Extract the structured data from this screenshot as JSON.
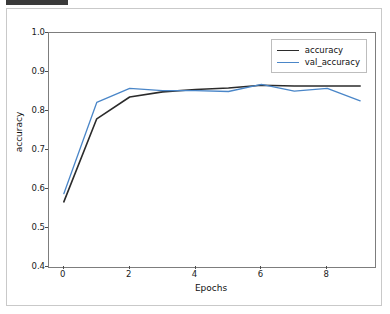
{
  "chart_data": {
    "type": "line",
    "title": "",
    "xlabel": "Epochs",
    "ylabel": "accuracy",
    "x": [
      0,
      1,
      2,
      3,
      4,
      5,
      6,
      7,
      8,
      9
    ],
    "xlim": [
      -0.45,
      9.45
    ],
    "ylim": [
      0.4,
      1.0
    ],
    "xticks": [
      0,
      2,
      4,
      6,
      8
    ],
    "xtick_labels": [
      "0",
      "2",
      "4",
      "6",
      "8"
    ],
    "yticks": [
      0.4,
      0.5,
      0.6,
      0.7,
      0.8,
      0.9,
      1.0
    ],
    "ytick_labels": [
      "0.4",
      "0.5",
      "0.6",
      "0.7",
      "0.8",
      "0.9",
      "1.0"
    ],
    "grid": false,
    "legend_position": "upper right",
    "series": [
      {
        "name": "accuracy",
        "color": "#2b2b2b",
        "linewidth": 1.6,
        "values": [
          0.567,
          0.78,
          0.836,
          0.849,
          0.855,
          0.859,
          0.866,
          0.864,
          0.864,
          0.864
        ]
      },
      {
        "name": "val_accuracy",
        "color": "#4a86c8",
        "linewidth": 1.3,
        "values": [
          0.588,
          0.822,
          0.858,
          0.852,
          0.852,
          0.85,
          0.868,
          0.851,
          0.858,
          0.826
        ]
      }
    ]
  },
  "legend": {
    "entries": [
      {
        "label": "accuracy"
      },
      {
        "label": "val_accuracy"
      }
    ]
  },
  "axes": {
    "xlabel": "Epochs",
    "ylabel": "accuracy"
  }
}
